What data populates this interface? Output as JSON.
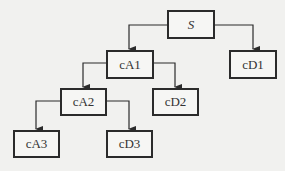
{
  "diagram": {
    "type": "tree",
    "colors": {
      "line": "#2b2b2b",
      "background": "#f1f1ef",
      "box_fill": "#f6f6f4"
    },
    "nodes": [
      {
        "id": "S",
        "label": "S",
        "x": 167,
        "y": 10,
        "w": 48,
        "h": 29
      },
      {
        "id": "cA1",
        "label": "cA1",
        "x": 106,
        "y": 50,
        "w": 48,
        "h": 29
      },
      {
        "id": "cD1",
        "label": "cD1",
        "x": 229,
        "y": 50,
        "w": 48,
        "h": 29
      },
      {
        "id": "cA2",
        "label": "cA2",
        "x": 60,
        "y": 88,
        "w": 47,
        "h": 28
      },
      {
        "id": "cD2",
        "label": "cD2",
        "x": 152,
        "y": 88,
        "w": 47,
        "h": 28
      },
      {
        "id": "cA3",
        "label": "cA3",
        "x": 13,
        "y": 130,
        "w": 47,
        "h": 28
      },
      {
        "id": "cD3",
        "label": "cD3",
        "x": 106,
        "y": 130,
        "w": 47,
        "h": 28
      }
    ],
    "edges": [
      {
        "from": "S",
        "to": "cA1"
      },
      {
        "from": "S",
        "to": "cD1"
      },
      {
        "from": "cA1",
        "to": "cA2"
      },
      {
        "from": "cA1",
        "to": "cD2"
      },
      {
        "from": "cA2",
        "to": "cA3"
      },
      {
        "from": "cA2",
        "to": "cD3"
      }
    ]
  }
}
